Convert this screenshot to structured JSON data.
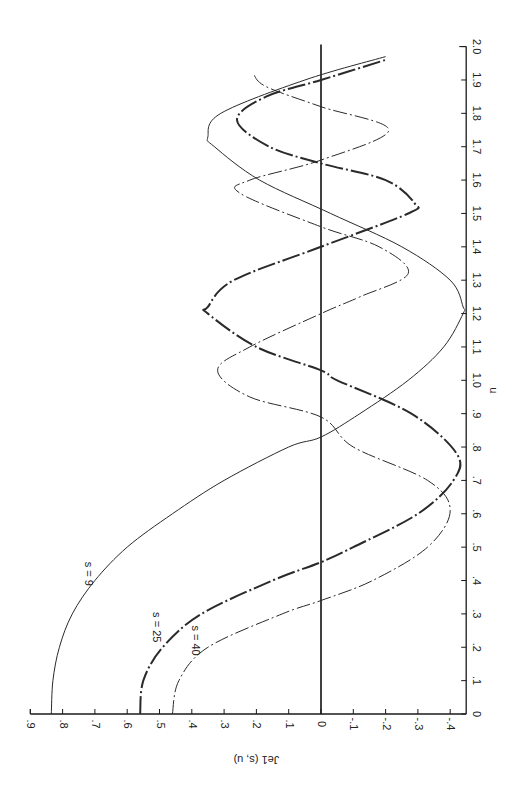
{
  "chart_data": {
    "type": "line",
    "title": "",
    "orientation": "rotated 90° (u axis vertical on right, Je1 axis horizontal at bottom, printed sideways)",
    "xlabel": "u",
    "ylabel": "Je1 (s, u)",
    "xlim": [
      0,
      2.0
    ],
    "ylim": [
      -0.4,
      0.9
    ],
    "x_ticks": [
      "0",
      ".1",
      ".2",
      ".3",
      ".4",
      ".5",
      ".6",
      ".7",
      ".8",
      ".9",
      "1.0",
      "1.1",
      "1.2",
      "1.3",
      "1.4",
      "1.5",
      "1.6",
      "1.7",
      "1.8",
      "1.9",
      "2.0"
    ],
    "y_ticks": [
      ".9",
      ".8",
      ".7",
      ".6",
      ".5",
      ".4",
      ".3",
      ".2",
      ".1",
      "0",
      "-.1",
      "-.2",
      "-.3",
      "-.4"
    ],
    "grid": false,
    "legend": "inline labels on curves",
    "series": [
      {
        "name": "s=9",
        "style": "thin solid",
        "x": [
          0,
          0.1,
          0.2,
          0.3,
          0.4,
          0.5,
          0.6,
          0.7,
          0.8,
          0.83,
          0.9,
          1.0,
          1.1,
          1.2,
          1.22,
          1.3,
          1.4,
          1.5,
          1.6,
          1.7,
          1.73,
          1.8,
          1.9,
          1.97
        ],
        "values": [
          0.835,
          0.83,
          0.81,
          0.77,
          0.7,
          0.6,
          0.46,
          0.3,
          0.1,
          0.0,
          -0.12,
          -0.27,
          -0.38,
          -0.44,
          -0.44,
          -0.4,
          -0.25,
          -0.03,
          0.19,
          0.33,
          0.35,
          0.31,
          0.05,
          -0.2
        ]
      },
      {
        "name": "s=25",
        "style": "heavy dash-dot",
        "x": [
          0,
          0.1,
          0.2,
          0.3,
          0.4,
          0.455,
          0.5,
          0.6,
          0.7,
          0.78,
          0.9,
          1.0,
          1.03,
          1.1,
          1.2,
          1.22,
          1.3,
          1.4,
          1.5,
          1.53,
          1.6,
          1.65,
          1.7,
          1.78,
          1.85,
          1.9,
          1.96
        ],
        "values": [
          0.56,
          0.55,
          0.49,
          0.37,
          0.15,
          0.0,
          -0.1,
          -0.3,
          -0.41,
          -0.42,
          -0.28,
          -0.05,
          0.0,
          0.2,
          0.35,
          0.35,
          0.27,
          0.0,
          -0.27,
          -0.29,
          -0.2,
          0.0,
          0.16,
          0.26,
          0.17,
          0.0,
          -0.2
        ]
      },
      {
        "name": "s=40",
        "style": "thin dash-dot",
        "x": [
          0,
          0.1,
          0.2,
          0.3,
          0.34,
          0.4,
          0.5,
          0.61,
          0.7,
          0.8,
          0.89,
          0.95,
          1.03,
          1.1,
          1.2,
          1.25,
          1.32,
          1.4,
          1.46,
          1.56,
          1.6,
          1.66,
          1.75,
          1.82,
          1.88,
          1.92
        ],
        "values": [
          0.46,
          0.44,
          0.35,
          0.12,
          0.0,
          -0.16,
          -0.33,
          -0.4,
          -0.33,
          -0.1,
          0.0,
          0.22,
          0.32,
          0.22,
          0.0,
          -0.12,
          -0.27,
          -0.18,
          0.0,
          0.25,
          0.22,
          0.0,
          -0.21,
          0.0,
          0.17,
          0.21
        ]
      }
    ],
    "annotations": [
      "s = 9",
      "s = 25",
      "s = 40"
    ]
  }
}
